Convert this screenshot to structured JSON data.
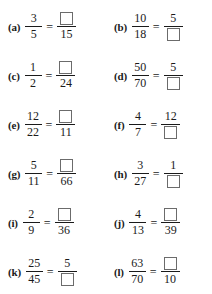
{
  "worksheet": {
    "title": "Equivalent fractions fill-in-the-blank exercise",
    "blank_symbol": "□",
    "equals_symbol": "=",
    "columns": 2,
    "rows": 6,
    "total_problems": 12,
    "colors": {
      "text": "#1a1a1a",
      "background": "#ffffff",
      "blank_box_border": "#6b6b6b",
      "fraction_bar": "#1a1a1a"
    },
    "problems": [
      {
        "id": "a",
        "label": "(a)",
        "left": {
          "numerator": "3",
          "denominator": "5",
          "numerator_blank": false,
          "denominator_blank": false
        },
        "right": {
          "numerator": "",
          "denominator": "15",
          "numerator_blank": true,
          "denominator_blank": false
        },
        "answer": "9"
      },
      {
        "id": "b",
        "label": "(b)",
        "left": {
          "numerator": "10",
          "denominator": "18",
          "numerator_blank": false,
          "denominator_blank": false
        },
        "right": {
          "numerator": "5",
          "denominator": "",
          "numerator_blank": false,
          "denominator_blank": true
        },
        "answer": "9"
      },
      {
        "id": "c",
        "label": "(c)",
        "left": {
          "numerator": "1",
          "denominator": "2",
          "numerator_blank": false,
          "denominator_blank": false
        },
        "right": {
          "numerator": "",
          "denominator": "24",
          "numerator_blank": true,
          "denominator_blank": false
        },
        "answer": "12"
      },
      {
        "id": "d",
        "label": "(d)",
        "left": {
          "numerator": "50",
          "denominator": "70",
          "numerator_blank": false,
          "denominator_blank": false
        },
        "right": {
          "numerator": "5",
          "denominator": "",
          "numerator_blank": false,
          "denominator_blank": true
        },
        "answer": "7"
      },
      {
        "id": "e",
        "label": "(e)",
        "left": {
          "numerator": "12",
          "denominator": "22",
          "numerator_blank": false,
          "denominator_blank": false
        },
        "right": {
          "numerator": "",
          "denominator": "11",
          "numerator_blank": true,
          "denominator_blank": false
        },
        "answer": "6"
      },
      {
        "id": "f",
        "label": "(f)",
        "left": {
          "numerator": "4",
          "denominator": "7",
          "numerator_blank": false,
          "denominator_blank": false
        },
        "right": {
          "numerator": "12",
          "denominator": "",
          "numerator_blank": false,
          "denominator_blank": true
        },
        "answer": "21"
      },
      {
        "id": "g",
        "label": "(g)",
        "left": {
          "numerator": "5",
          "denominator": "11",
          "numerator_blank": false,
          "denominator_blank": false
        },
        "right": {
          "numerator": "",
          "denominator": "66",
          "numerator_blank": true,
          "denominator_blank": false
        },
        "answer": "30"
      },
      {
        "id": "h",
        "label": "(h)",
        "left": {
          "numerator": "3",
          "denominator": "27",
          "numerator_blank": false,
          "denominator_blank": false
        },
        "right": {
          "numerator": "1",
          "denominator": "",
          "numerator_blank": false,
          "denominator_blank": true
        },
        "answer": "9"
      },
      {
        "id": "i",
        "label": "(i)",
        "left": {
          "numerator": "2",
          "denominator": "9",
          "numerator_blank": false,
          "denominator_blank": false
        },
        "right": {
          "numerator": "",
          "denominator": "36",
          "numerator_blank": true,
          "denominator_blank": false
        },
        "answer": "8"
      },
      {
        "id": "j",
        "label": "(j)",
        "left": {
          "numerator": "4",
          "denominator": "13",
          "numerator_blank": false,
          "denominator_blank": false
        },
        "right": {
          "numerator": "",
          "denominator": "39",
          "numerator_blank": true,
          "denominator_blank": false
        },
        "answer": "12"
      },
      {
        "id": "k",
        "label": "(k)",
        "left": {
          "numerator": "25",
          "denominator": "45",
          "numerator_blank": false,
          "denominator_blank": false
        },
        "right": {
          "numerator": "5",
          "denominator": "",
          "numerator_blank": false,
          "denominator_blank": true
        },
        "answer": "9"
      },
      {
        "id": "l",
        "label": "(l)",
        "left": {
          "numerator": "63",
          "denominator": "70",
          "numerator_blank": false,
          "denominator_blank": false
        },
        "right": {
          "numerator": "",
          "denominator": "10",
          "numerator_blank": true,
          "denominator_blank": false
        },
        "answer": "9"
      }
    ]
  }
}
